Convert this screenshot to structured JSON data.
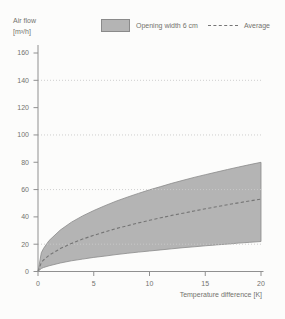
{
  "labels": {
    "ylabel_line1": "Air flow",
    "ylabel_line2": "[m³/h]",
    "xlabel": "Temperature difference [K]"
  },
  "legend": {
    "band_label": "Opening width 6 cm",
    "average_label": "Average"
  },
  "colors": {
    "band_fill": "#b4b4b4",
    "band_stroke": "#8a8a8a",
    "average_line": "#757575",
    "grid": "#c9c9c9",
    "axis": "#909090",
    "text": "#73736e",
    "background": "#fcfcfb"
  },
  "chart_data": {
    "type": "area",
    "title": "",
    "ylabel": "Air flow [m³/h]",
    "xlabel": "Temperature difference [K]",
    "xlim": [
      0,
      20
    ],
    "ylim": [
      0,
      160
    ],
    "x_ticks": [
      0,
      5,
      10,
      15,
      20
    ],
    "y_ticks": [
      0,
      20,
      40,
      60,
      80,
      100,
      120,
      140,
      160
    ],
    "gridlines_y": [
      20,
      60,
      100,
      140
    ],
    "legend_position": "top",
    "x": [
      0,
      0.3,
      0.5,
      1,
      2,
      3,
      4,
      5,
      6,
      7,
      8,
      9,
      10,
      11,
      12,
      13,
      14,
      15,
      16,
      17,
      18,
      19,
      20
    ],
    "series": [
      {
        "name": "Opening width 6 cm (band upper)",
        "type": "area-upper",
        "values": [
          0,
          13.7,
          17,
          22.7,
          30.4,
          36.1,
          40.7,
          44.7,
          48.2,
          51.5,
          54.4,
          57.2,
          59.8,
          62.2,
          64.6,
          66.8,
          68.9,
          70.9,
          72.8,
          74.7,
          76.5,
          78.3,
          80
        ]
      },
      {
        "name": "Average",
        "type": "dashed-line",
        "values": [
          0,
          6.5,
          8.4,
          11.9,
          16.8,
          20.5,
          23.7,
          26.5,
          29,
          31.4,
          33.5,
          35.6,
          37.5,
          39.3,
          41.1,
          42.7,
          44.3,
          45.9,
          47.4,
          48.9,
          50.3,
          51.7,
          53
        ]
      },
      {
        "name": "Opening width 6 cm (band lower)",
        "type": "area-lower",
        "values": [
          0,
          2.2,
          2.9,
          4.2,
          6.2,
          7.8,
          9.1,
          10.3,
          11.3,
          12.4,
          13.3,
          14.2,
          15,
          15.8,
          16.6,
          17.4,
          18.1,
          18.8,
          19.5,
          20.1,
          20.8,
          21.4,
          22
        ]
      }
    ]
  }
}
